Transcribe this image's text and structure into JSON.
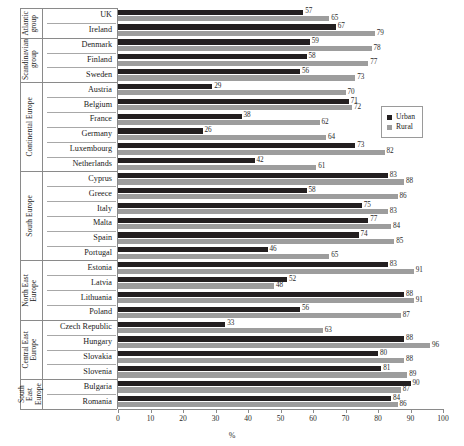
{
  "chart_data": {
    "type": "bar",
    "orientation": "horizontal",
    "title": "",
    "xlabel": "%",
    "ylabel": "",
    "xlim": [
      0,
      100
    ],
    "xticks": [
      0,
      10,
      20,
      30,
      40,
      50,
      60,
      70,
      80,
      90,
      100
    ],
    "grid": false,
    "legend": {
      "position": "right-upper",
      "entries": [
        {
          "name": "Urban",
          "color": "#231f20"
        },
        {
          "name": "Rural",
          "color": "#9d9d9d"
        }
      ]
    },
    "series": [
      {
        "name": "Urban",
        "color": "#231f20"
      },
      {
        "name": "Rural",
        "color": "#9d9d9d"
      }
    ],
    "groups": [
      {
        "label": "Atlantic\ngroup",
        "categories": [
          "UK",
          "Ireland"
        ],
        "urban": [
          57,
          67
        ],
        "rural": [
          65,
          79
        ]
      },
      {
        "label": "Scandinavian\ngroup",
        "categories": [
          "Denmark",
          "Finland",
          "Sweden"
        ],
        "urban": [
          59,
          58,
          56
        ],
        "rural": [
          78,
          77,
          73
        ]
      },
      {
        "label": "Continental Europe",
        "categories": [
          "Austria",
          "Belgium",
          "France",
          "Germany",
          "Luxembourg",
          "Netherlands"
        ],
        "urban": [
          29,
          71,
          38,
          26,
          73,
          42
        ],
        "rural": [
          70,
          72,
          62,
          64,
          82,
          61
        ]
      },
      {
        "label": "South Europe",
        "categories": [
          "Cyprus",
          "Greece",
          "Italy",
          "Malta",
          "Spain",
          "Portugal"
        ],
        "urban": [
          83,
          58,
          75,
          77,
          74,
          46
        ],
        "rural": [
          88,
          86,
          83,
          84,
          85,
          65
        ]
      },
      {
        "label": "North East\nEurope",
        "categories": [
          "Estonia",
          "Latvia",
          "Lithuania",
          "Poland"
        ],
        "urban": [
          83,
          52,
          88,
          56
        ],
        "rural": [
          91,
          48,
          91,
          87
        ]
      },
      {
        "label": "Central East\nEurope",
        "categories": [
          "Czech Republic",
          "Hungary",
          "Slovakia",
          "Slovenia"
        ],
        "urban": [
          33,
          88,
          80,
          81
        ],
        "rural": [
          63,
          96,
          88,
          89
        ]
      },
      {
        "label": "South\nEast\nEurope",
        "categories": [
          "Bulgaria",
          "Romania"
        ],
        "urban": [
          90,
          84
        ],
        "rural": [
          87,
          86
        ]
      }
    ]
  }
}
